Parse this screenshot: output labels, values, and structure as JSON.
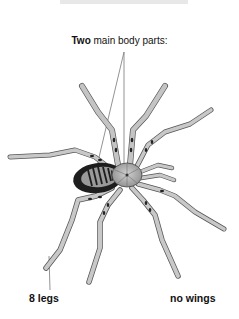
{
  "diagram": {
    "title_bold": "Two",
    "title_rest": " main body parts:",
    "labels": {
      "legs": "8 legs",
      "wings": "no wings"
    },
    "body_parts": [
      "cephalothorax",
      "abdomen"
    ],
    "leg_count": 8
  }
}
